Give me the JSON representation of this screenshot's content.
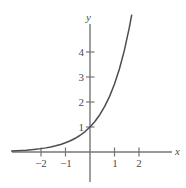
{
  "chart_data": {
    "type": "line",
    "title": "",
    "xlabel": "x",
    "ylabel": "y",
    "xlim": [
      -3.2,
      3.35
    ],
    "ylim": [
      -1.2,
      5.2
    ],
    "grid": false,
    "legend": null,
    "function": "y = e^x",
    "xticks": [
      -2,
      -1,
      1,
      2
    ],
    "xtick_labels": [
      "−2",
      "−1",
      "1",
      "2"
    ],
    "yticks": [
      1,
      2,
      3,
      4
    ],
    "ytick_labels": [
      "1",
      "2",
      "3",
      "4"
    ],
    "series": [
      {
        "name": "exponential-curve",
        "color": "#4d4d4d",
        "x": [
          -3.2,
          -3.0,
          -2.8,
          -2.6,
          -2.4,
          -2.2,
          -2.0,
          -1.8,
          -1.6,
          -1.4,
          -1.2,
          -1.0,
          -0.8,
          -0.6,
          -0.4,
          -0.2,
          0.0,
          0.2,
          0.4,
          0.6,
          0.8,
          1.0,
          1.2,
          1.4,
          1.6,
          1.7
        ],
        "y": [
          0.041,
          0.05,
          0.061,
          0.074,
          0.091,
          0.111,
          0.135,
          0.165,
          0.202,
          0.247,
          0.301,
          0.368,
          0.449,
          0.549,
          0.67,
          0.819,
          1.0,
          1.221,
          1.492,
          1.822,
          2.226,
          2.718,
          3.32,
          4.055,
          4.953,
          5.474
        ]
      }
    ],
    "marked_points": [
      {
        "label": "y-intercept",
        "x": 0,
        "y": 1
      }
    ],
    "axis_color": "#767676",
    "curve_color": "#4d4d4d",
    "background": "#ffffff"
  },
  "labels": {
    "x_axis": "x",
    "y_axis": "y",
    "x_neg2": "−2",
    "x_neg1": "−1",
    "x_pos1": "1",
    "x_pos2": "2",
    "y_1": "1",
    "y_2": "2",
    "y_3": "3",
    "y_4": "4"
  }
}
